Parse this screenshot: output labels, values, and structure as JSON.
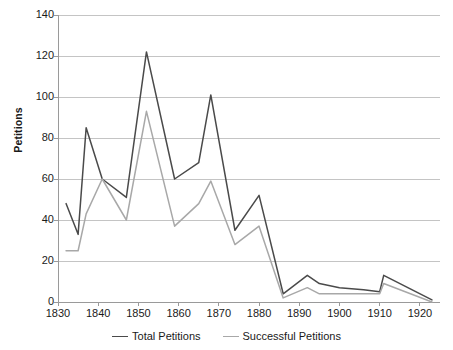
{
  "chart_data": {
    "type": "line",
    "title": "",
    "xlabel": "",
    "ylabel": "Petitions",
    "xlim": [
      1830,
      1925
    ],
    "ylim": [
      0,
      140
    ],
    "yticks": [
      0,
      20,
      40,
      60,
      80,
      100,
      120,
      140
    ],
    "xticks": [
      1830,
      1840,
      1850,
      1860,
      1870,
      1880,
      1890,
      1900,
      1910,
      1920
    ],
    "grid": "horizontal",
    "legend_position": "bottom",
    "series": [
      {
        "name": "Total Petitions",
        "color": "#4a4a4a",
        "x": [
          1832,
          1835,
          1837,
          1841,
          1847,
          1852,
          1859,
          1865,
          1868,
          1874,
          1880,
          1886,
          1892,
          1895,
          1900,
          1906,
          1910,
          1911,
          1923
        ],
        "values": [
          48,
          33,
          85,
          60,
          51,
          122,
          60,
          68,
          101,
          35,
          52,
          4,
          13,
          9,
          7,
          6,
          5,
          13,
          1
        ]
      },
      {
        "name": "Successful Petitions",
        "color": "#a8a8a8",
        "x": [
          1832,
          1835,
          1837,
          1841,
          1847,
          1852,
          1859,
          1865,
          1868,
          1874,
          1880,
          1886,
          1892,
          1895,
          1900,
          1906,
          1910,
          1911,
          1923
        ],
        "values": [
          25,
          25,
          43,
          60,
          40,
          93,
          37,
          48,
          59,
          28,
          37,
          2,
          7,
          4,
          4,
          4,
          4,
          9,
          0
        ]
      }
    ]
  },
  "axes": {
    "y_title": "Petitions",
    "y_labels": [
      "140",
      "120",
      "100",
      "80",
      "60",
      "40",
      "20",
      "0"
    ],
    "x_labels": [
      "1830",
      "1840",
      "1850",
      "1860",
      "1870",
      "1880",
      "1890",
      "1900",
      "1910",
      "1920"
    ]
  },
  "legend": {
    "items": [
      {
        "label": "Total Petitions",
        "color": "#4a4a4a"
      },
      {
        "label": "Successful Petitions",
        "color": "#a8a8a8"
      }
    ]
  },
  "colors": {
    "total": "#4a4a4a",
    "successful": "#a8a8a8",
    "grid": "#c4c4c4",
    "axis": "#9a9a9a",
    "background": "#ffffff"
  }
}
